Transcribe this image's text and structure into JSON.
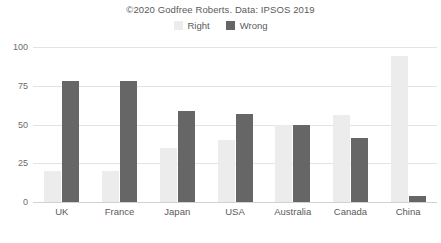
{
  "chart_data": {
    "type": "bar",
    "title": "©2020 Godfree Roberts. Data: IPSOS 2019",
    "xlabel": "",
    "ylabel": "",
    "ylim": [
      0,
      100
    ],
    "yticks": [
      0,
      25,
      50,
      75,
      100
    ],
    "grid": true,
    "legend_position": "top-center",
    "categories": [
      "UK",
      "France",
      "Japan",
      "USA",
      "Australia",
      "Canada",
      "China"
    ],
    "series": [
      {
        "name": "Right",
        "color": "#ececec",
        "values": [
          20,
          20,
          35,
          40,
          50,
          56,
          94
        ]
      },
      {
        "name": "Wrong",
        "color": "#666666",
        "values": [
          78,
          78,
          59,
          57,
          50,
          41,
          4
        ]
      }
    ]
  },
  "legend": {
    "items": [
      {
        "label": "Right",
        "color": "#ececec"
      },
      {
        "label": "Wrong",
        "color": "#666666"
      }
    ]
  },
  "axis": {
    "y_tick_labels": [
      "100",
      "75",
      "50",
      "25",
      "0"
    ]
  }
}
